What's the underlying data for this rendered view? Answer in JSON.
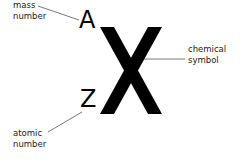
{
  "diagram": {
    "symbol": "X",
    "mass_number_letter": "A",
    "atomic_number_letter": "Z",
    "labels": {
      "mass_number": [
        "mass",
        "number"
      ],
      "chemical_symbol": [
        "chemical",
        "symbol"
      ],
      "atomic_number": [
        "atomic",
        "number"
      ]
    },
    "colors": {
      "text": "#000000",
      "leader_line": "#555555",
      "background": "#ffffff"
    }
  }
}
